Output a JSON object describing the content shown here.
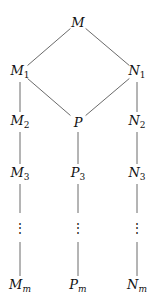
{
  "diagram": {
    "nodes": [
      {
        "id": "M",
        "base": "M",
        "sub": "",
        "x": 78,
        "y": 22
      },
      {
        "id": "M1",
        "base": "M",
        "sub": "1",
        "x": 20,
        "y": 72
      },
      {
        "id": "N1",
        "base": "N",
        "sub": "1",
        "x": 137,
        "y": 72
      },
      {
        "id": "M2",
        "base": "M",
        "sub": "2",
        "x": 20,
        "y": 122
      },
      {
        "id": "P",
        "base": "P",
        "sub": "",
        "x": 78,
        "y": 122
      },
      {
        "id": "N2",
        "base": "N",
        "sub": "2",
        "x": 137,
        "y": 122
      },
      {
        "id": "M3",
        "base": "M",
        "sub": "3",
        "x": 20,
        "y": 174
      },
      {
        "id": "P3",
        "base": "P",
        "sub": "3",
        "x": 78,
        "y": 174
      },
      {
        "id": "N3",
        "base": "N",
        "sub": "3",
        "x": 137,
        "y": 174
      },
      {
        "id": "Mm",
        "base": "M",
        "sub": "m",
        "x": 20,
        "y": 286
      },
      {
        "id": "Pm",
        "base": "P",
        "sub": "m",
        "x": 78,
        "y": 286
      },
      {
        "id": "Nm",
        "base": "N",
        "sub": "m",
        "x": 137,
        "y": 286
      }
    ],
    "edges": [
      [
        "M",
        "M1"
      ],
      [
        "M",
        "N1"
      ],
      [
        "M1",
        "P"
      ],
      [
        "N1",
        "P"
      ],
      [
        "M1",
        "M2"
      ],
      [
        "N1",
        "N2"
      ],
      [
        "M2",
        "M3"
      ],
      [
        "P",
        "P3"
      ],
      [
        "N2",
        "N3"
      ]
    ],
    "ellipsis_columns": [
      20,
      78,
      137
    ],
    "ellipsis_glyph": "⋮"
  }
}
